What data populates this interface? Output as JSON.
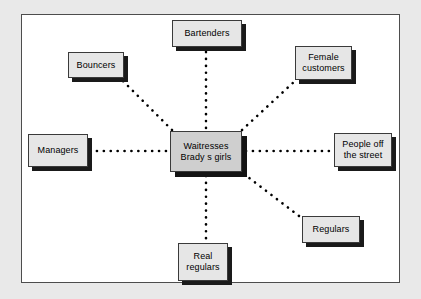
{
  "diagram": {
    "type": "hub-and-spoke network diagram",
    "panel": {
      "background_color": "#ffffff",
      "border_color": "#4d4d4d",
      "page_background_color": "#e9e9e9"
    },
    "style": {
      "node_fill": "#e6e6e6",
      "center_node_fill": "#cfcfcf",
      "node_border": "#3a3a3a",
      "shadow_color": "#1a1a1a",
      "connector_color": "#000000",
      "connector_style": "dotted"
    },
    "center_node": {
      "id": "center",
      "label": "Waitresses\nBrady s girls",
      "line1": "Waitresses",
      "line2": "Brady s girls"
    },
    "nodes": [
      {
        "id": "bartenders",
        "label": "Bartenders",
        "position": "top"
      },
      {
        "id": "bouncers",
        "label": "Bouncers",
        "position": "upper-left"
      },
      {
        "id": "female-customers",
        "label": "Female\ncustomers",
        "position": "upper-right"
      },
      {
        "id": "managers",
        "label": "Managers",
        "position": "left"
      },
      {
        "id": "people-off-street",
        "label": "People off\nthe street",
        "position": "right"
      },
      {
        "id": "regulars",
        "label": "Regulars",
        "position": "lower-right"
      },
      {
        "id": "real-regulars",
        "label": "Real\nregulars",
        "position": "bottom"
      }
    ],
    "edges": [
      {
        "from": "center",
        "to": "bartenders"
      },
      {
        "from": "center",
        "to": "bouncers"
      },
      {
        "from": "center",
        "to": "female-customers"
      },
      {
        "from": "center",
        "to": "managers"
      },
      {
        "from": "center",
        "to": "people-off-street"
      },
      {
        "from": "center",
        "to": "regulars"
      },
      {
        "from": "center",
        "to": "real-regulars"
      }
    ]
  }
}
